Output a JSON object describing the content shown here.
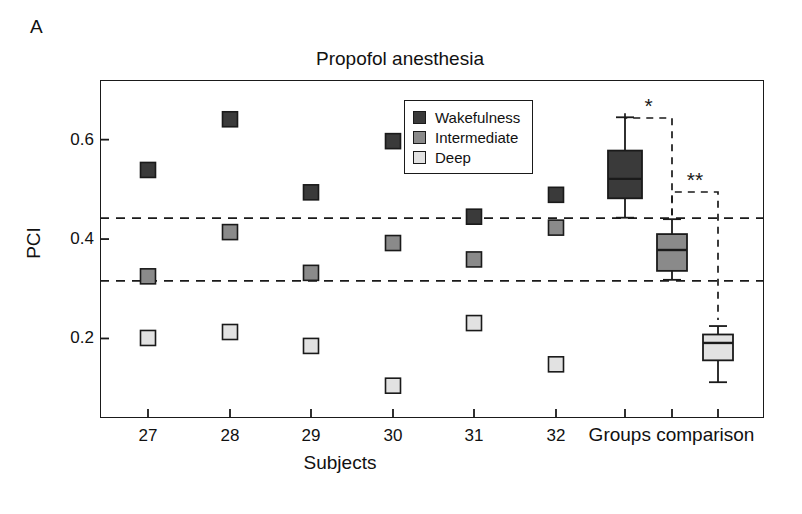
{
  "panel": {
    "label": "A"
  },
  "legend": {
    "items": [
      {
        "label": "Wakefulness",
        "color": "#3a3a3a"
      },
      {
        "label": "Intermediate",
        "color": "#8a8a8a"
      },
      {
        "label": "Deep",
        "color": "#e2e2e2"
      }
    ]
  },
  "annotations": {
    "sig1": "*",
    "sig2": "**"
  },
  "chart_data": {
    "type": "scatter",
    "title": "Propofol anesthesia",
    "xlabel": "Subjects",
    "ylabel": "PCI",
    "ylim": [
      0.04,
      0.72
    ],
    "yticks": [
      0.2,
      0.4,
      0.6
    ],
    "ytick_labels": [
      "0.2",
      "0.4",
      "0.6"
    ],
    "grid": false,
    "legend_position": "upper-center",
    "categories": [
      "27",
      "28",
      "29",
      "30",
      "31",
      "32"
    ],
    "group_axis_label": "Groups comparison",
    "series": [
      {
        "name": "Wakefulness",
        "color": "#3a3a3a",
        "values": [
          0.539,
          0.641,
          0.494,
          0.597,
          0.445,
          0.489
        ]
      },
      {
        "name": "Intermediate",
        "color": "#8a8a8a",
        "values": [
          0.325,
          0.414,
          0.332,
          0.392,
          0.359,
          0.423
        ]
      },
      {
        "name": "Deep",
        "color": "#e2e2e2",
        "values": [
          0.201,
          0.213,
          0.185,
          0.105,
          0.231,
          0.148
        ]
      }
    ],
    "threshold_lines": [
      {
        "name": "upper-threshold",
        "value": 0.442,
        "style": "dashed"
      },
      {
        "name": "lower-threshold",
        "value": 0.316,
        "style": "dashed"
      }
    ],
    "boxplots": [
      {
        "name": "Wakefulness",
        "color": "#3a3a3a",
        "whisker_low": 0.443,
        "q1": 0.482,
        "median": 0.521,
        "q3": 0.578,
        "whisker_high": 0.645
      },
      {
        "name": "Intermediate",
        "color": "#8a8a8a",
        "whisker_low": 0.318,
        "q1": 0.336,
        "median": 0.378,
        "q3": 0.41,
        "whisker_high": 0.44
      },
      {
        "name": "Deep",
        "color": "#e2e2e2",
        "whisker_low": 0.112,
        "q1": 0.156,
        "median": 0.191,
        "q3": 0.208,
        "whisker_high": 0.225
      }
    ],
    "significance": [
      {
        "label": "*",
        "from": "Wakefulness",
        "to": "Intermediate"
      },
      {
        "label": "**",
        "from": "Intermediate",
        "to": "Deep"
      }
    ]
  }
}
